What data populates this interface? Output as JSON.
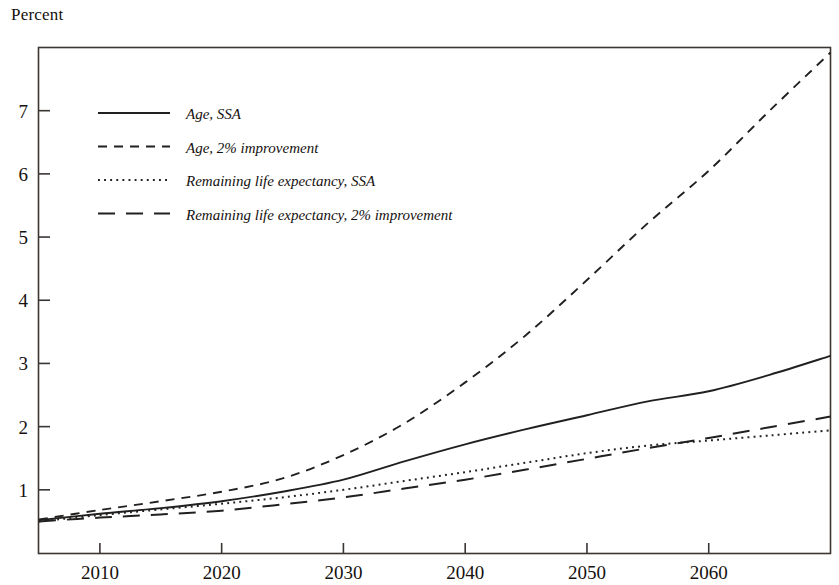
{
  "figure": {
    "y_axis_title": "Percent"
  },
  "chart_data": {
    "type": "line",
    "title": "",
    "subtitle": "",
    "xlabel": "",
    "ylabel": "Percent",
    "grid": false,
    "legend_position": "upper-left inside plot area",
    "xlim": [
      2005,
      2070
    ],
    "ylim": [
      0,
      8.0
    ],
    "x_ticks": [
      2010,
      2020,
      2030,
      2040,
      2050,
      2060
    ],
    "y_ticks": [
      1,
      2,
      3,
      4,
      5,
      6,
      7
    ],
    "x_tick_labels": [
      "2010",
      "2020",
      "2030",
      "2040",
      "2050",
      "2060"
    ],
    "y_tick_labels": [
      "1",
      "2",
      "3",
      "4",
      "5",
      "6",
      "7"
    ],
    "x": [
      2005,
      2010,
      2015,
      2020,
      2025,
      2030,
      2035,
      2040,
      2045,
      2050,
      2055,
      2060,
      2065,
      2070
    ],
    "series": [
      {
        "name": "Age, SSA",
        "style": "solid",
        "values": [
          0.52,
          0.62,
          0.71,
          0.82,
          0.97,
          1.16,
          1.45,
          1.72,
          1.96,
          2.18,
          2.4,
          2.56,
          2.82,
          3.12
        ]
      },
      {
        "name": "Age, 2% improvement",
        "style": "dashed",
        "values": [
          0.53,
          0.68,
          0.82,
          0.97,
          1.18,
          1.55,
          2.05,
          2.7,
          3.45,
          4.32,
          5.22,
          6.05,
          7.0,
          7.92
        ]
      },
      {
        "name": "Remaining life expectancy, SSA",
        "style": "dotted",
        "values": [
          0.5,
          0.6,
          0.69,
          0.78,
          0.88,
          1.0,
          1.14,
          1.28,
          1.43,
          1.58,
          1.7,
          1.78,
          1.86,
          1.94
        ]
      },
      {
        "name": "Remaining life expectancy, 2% improvement",
        "style": "longdash",
        "values": [
          0.5,
          0.56,
          0.61,
          0.67,
          0.77,
          0.88,
          1.02,
          1.16,
          1.32,
          1.49,
          1.66,
          1.82,
          1.99,
          2.16
        ]
      }
    ]
  },
  "legend": {
    "items": [
      {
        "label": "Age, SSA",
        "style": "solid"
      },
      {
        "label": "Age, 2% improvement",
        "style": "dashed"
      },
      {
        "label": "Remaining life expectancy, SSA",
        "style": "dotted"
      },
      {
        "label": "Remaining life expectancy, 2% improvement",
        "style": "longdash"
      }
    ]
  }
}
